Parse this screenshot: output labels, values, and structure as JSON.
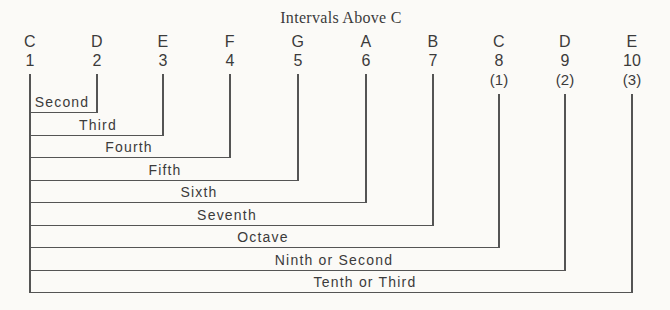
{
  "diagram": {
    "title": "Intervals Above C",
    "columns": [
      {
        "note": "C",
        "degree": "1",
        "annotation": ""
      },
      {
        "note": "D",
        "degree": "2",
        "annotation": ""
      },
      {
        "note": "E",
        "degree": "3",
        "annotation": ""
      },
      {
        "note": "F",
        "degree": "4",
        "annotation": ""
      },
      {
        "note": "G",
        "degree": "5",
        "annotation": ""
      },
      {
        "note": "A",
        "degree": "6",
        "annotation": ""
      },
      {
        "note": "B",
        "degree": "7",
        "annotation": ""
      },
      {
        "note": "C",
        "degree": "8",
        "annotation": "(1)"
      },
      {
        "note": "D",
        "degree": "9",
        "annotation": "(2)"
      },
      {
        "note": "E",
        "degree": "10",
        "annotation": "(3)"
      }
    ],
    "intervals": [
      {
        "label": "Second",
        "from_degree": "1",
        "to_degree": "2"
      },
      {
        "label": "Third",
        "from_degree": "1",
        "to_degree": "3"
      },
      {
        "label": "Fourth",
        "from_degree": "1",
        "to_degree": "4"
      },
      {
        "label": "Fifth",
        "from_degree": "1",
        "to_degree": "5"
      },
      {
        "label": "Sixth",
        "from_degree": "1",
        "to_degree": "6"
      },
      {
        "label": "Seventh",
        "from_degree": "1",
        "to_degree": "7"
      },
      {
        "label": "Octave",
        "from_degree": "1",
        "to_degree": "8"
      },
      {
        "label": "Ninth or Second",
        "from_degree": "1",
        "to_degree": "9"
      },
      {
        "label": "Tenth or Third",
        "from_degree": "1",
        "to_degree": "10"
      }
    ],
    "colors": {
      "ink": "#3b3b3b",
      "line": "#545454",
      "background": "#fbfaf7"
    }
  }
}
